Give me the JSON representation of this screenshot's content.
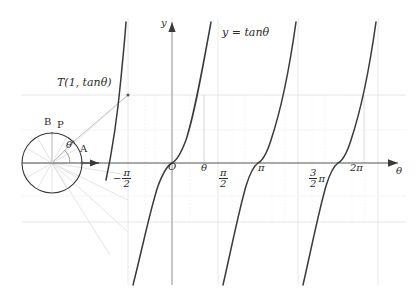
{
  "figure": {
    "title_label": "y = tanθ",
    "axes": {
      "y_axis_label": "y",
      "x_axis_label": "θ",
      "origin_label": "O"
    },
    "x_ticks": [
      {
        "id": "neg-half-pi",
        "kind": "fraction",
        "sign": "−",
        "num": "π",
        "den": "2",
        "x": 113,
        "y": 168
      },
      {
        "id": "origin",
        "kind": "plain",
        "text": "O",
        "x": 168,
        "y": 162
      },
      {
        "id": "theta",
        "kind": "plain",
        "text": "θ",
        "x": 201,
        "y": 163
      },
      {
        "id": "half-pi",
        "kind": "fraction",
        "sign": "",
        "num": "π",
        "den": "2",
        "x": 219,
        "y": 168
      },
      {
        "id": "pi",
        "kind": "plain",
        "text": "π",
        "x": 258,
        "y": 163
      },
      {
        "id": "three-halves-pi",
        "kind": "fraction-suffix",
        "sign": "",
        "num": "3",
        "den": "2",
        "suffix": "π",
        "x": 309,
        "y": 168
      },
      {
        "id": "two-pi",
        "kind": "plain",
        "text": "2π",
        "x": 350,
        "y": 163
      }
    ],
    "circle": {
      "center_x": 52,
      "center_y": 163,
      "radius": 30,
      "point_a_label": "A",
      "point_b_label": "B",
      "point_p_label": "P",
      "angle_label": "θ"
    },
    "tangent_point": {
      "label": "T(1, tanθ)",
      "x": 128,
      "y": 95
    },
    "colors": {
      "curve": "#3a3a3a",
      "axis": "#555555",
      "grid": "#d8d8d8",
      "grid_faint": "#ececec",
      "construction": "#c9c9c9",
      "text": "#2b2b2b"
    }
  },
  "chart_data": {
    "type": "line",
    "title": "y = tanθ",
    "xlabel": "θ",
    "ylabel": "y",
    "xlim": [
      -2.35619,
      7.33038
    ],
    "ylim": [
      -3.9,
      3.9
    ],
    "grid": true,
    "legend": "none",
    "asymptotes": [
      -1.5708,
      1.5708,
      4.71239,
      7.85398
    ],
    "gridlines_y": [
      1.732,
      -1.732
    ],
    "branches": [
      {
        "name": "branch -pi/2",
        "domain": [
          -2.35619,
          -1.5708
        ]
      },
      {
        "name": "branch 0",
        "domain": [
          -1.5708,
          1.5708
        ]
      },
      {
        "name": "branch pi",
        "domain": [
          1.5708,
          4.71239
        ]
      },
      {
        "name": "branch 2pi",
        "domain": [
          4.71239,
          7.33038
        ]
      }
    ],
    "annotations": [
      {
        "text": "T(1, tanθ)",
        "role": "tangent-point-label"
      },
      {
        "text": "θ",
        "role": "angle-marker"
      },
      {
        "text": "A",
        "role": "circle-point"
      },
      {
        "text": "B",
        "role": "circle-point"
      },
      {
        "text": "P",
        "role": "circle-point"
      },
      {
        "text": "O",
        "role": "origin"
      }
    ]
  }
}
